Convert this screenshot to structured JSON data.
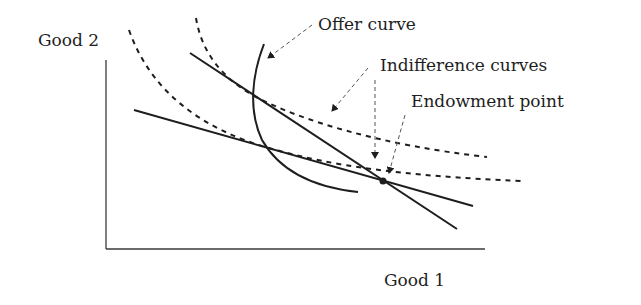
{
  "diagram": {
    "axes": {
      "y_label": "Good 2",
      "x_label": "Good 1"
    },
    "annotations": {
      "offer_curve": "Offer curve",
      "indifference_curves": "Indifference curves",
      "endowment_point": "Endowment point"
    },
    "elements": [
      {
        "type": "axis",
        "name": "vertical-axis"
      },
      {
        "type": "axis",
        "name": "horizontal-axis"
      },
      {
        "type": "solid-line",
        "name": "steep-budget-line"
      },
      {
        "type": "solid-line",
        "name": "flat-budget-line"
      },
      {
        "type": "solid-curve",
        "name": "offer-curve"
      },
      {
        "type": "dashed-curve",
        "name": "upper-indifference-curve"
      },
      {
        "type": "dashed-curve",
        "name": "lower-indifference-curve"
      },
      {
        "type": "point",
        "name": "endowment-point"
      }
    ],
    "colors": {
      "ink": "#1e1e1e",
      "axis": "#3a3a3a",
      "arrow": "#555555",
      "background": "#ffffff"
    }
  }
}
